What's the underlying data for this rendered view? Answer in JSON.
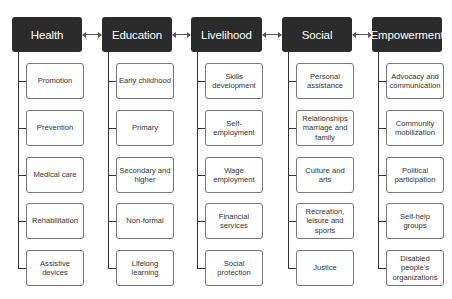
{
  "diagram": {
    "type": "hierarchy",
    "columns": [
      {
        "title": "Health",
        "items": [
          "Promotion",
          "Prevention",
          "Medical care",
          "Rehabilitation",
          "Assistive devices"
        ]
      },
      {
        "title": "Education",
        "items": [
          "Early childhood",
          "Primary",
          "Secondary and higher",
          "Non-formal",
          "Lifelong learning"
        ]
      },
      {
        "title": "Livelihood",
        "items": [
          "Skills development",
          "Self-employment",
          "Wage employment",
          "Financial services",
          "Social protection"
        ]
      },
      {
        "title": "Social",
        "items": [
          "Personal assistance",
          "Relationships marriage and family",
          "Culture and arts",
          "Recreation, leisure and sports",
          "Justice"
        ]
      },
      {
        "title": "Empowerment",
        "items": [
          "Advocacy and communication",
          "Community mobilization",
          "Political participation",
          "Self-help groups",
          "Disabled people's organizations"
        ]
      }
    ],
    "connectors": [
      {
        "from": "Health",
        "to": "Education",
        "type": "bidirectional-arrow"
      },
      {
        "from": "Education",
        "to": "Livelihood",
        "type": "bidirectional-arrow"
      },
      {
        "from": "Livelihood",
        "to": "Social",
        "type": "bidirectional-arrow"
      },
      {
        "from": "Social",
        "to": "Empowerment",
        "type": "bidirectional-arrow"
      }
    ],
    "colors": {
      "header_bg": "#2b2b2b",
      "header_text": "#ffffff",
      "child_border": "#777777",
      "line": "#333333"
    }
  }
}
